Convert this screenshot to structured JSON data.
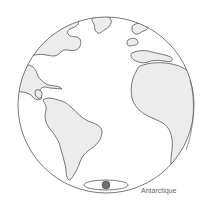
{
  "diagram": {
    "type": "globe",
    "view": "Atlantic hemisphere (Americas, Africa, Europe)",
    "top_caption": "",
    "colors": {
      "ocean": "#ffffff",
      "land": "#ececec",
      "outline": "#555555",
      "pole_marker": "#6e6e6e"
    },
    "labels": {
      "antarctique": "Antarctique"
    }
  }
}
